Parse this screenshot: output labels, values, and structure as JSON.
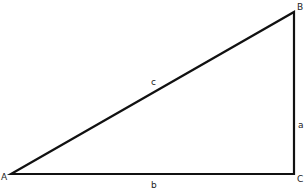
{
  "diagram": {
    "type": "right-triangle",
    "stroke_color": "#111111",
    "background": "#ffffff",
    "vertices": [
      {
        "label": "A",
        "x": 11,
        "y": 174
      },
      {
        "label": "B",
        "x": 294,
        "y": 12
      },
      {
        "label": "C",
        "x": 294,
        "y": 174
      }
    ],
    "sides": [
      {
        "label": "c",
        "from": "A",
        "to": "B"
      },
      {
        "label": "a",
        "from": "B",
        "to": "C"
      },
      {
        "label": "b",
        "from": "A",
        "to": "C"
      }
    ]
  },
  "labels": {
    "vertex_a": "A",
    "vertex_b": "B",
    "vertex_c": "C",
    "side_a": "a",
    "side_b": "b",
    "side_c": "c"
  }
}
